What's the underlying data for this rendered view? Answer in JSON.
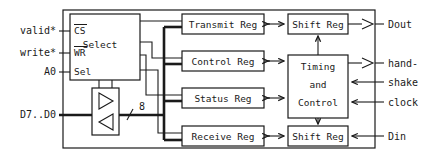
{
  "diagram": {
    "colors": {
      "line": "#1a1a1a",
      "background": "#ffffff",
      "box_fill": "#ffffff"
    }
  },
  "inputs_left": [
    {
      "label": "valid*",
      "name": "input-valid"
    },
    {
      "label": "write*",
      "name": "input-write"
    },
    {
      "label": "A0",
      "name": "input-a0"
    },
    {
      "label": "D7..D0",
      "name": "input-data-bus"
    }
  ],
  "select_block": {
    "label": "Select",
    "pins": [
      {
        "label": "CS",
        "overline": true
      },
      {
        "label": "WR",
        "overline": true
      },
      {
        "label": "Sel",
        "overline": false
      }
    ]
  },
  "bus": {
    "width_label": "8"
  },
  "registers": [
    {
      "label": "Transmit Reg",
      "name": "block-transmit-reg"
    },
    {
      "label": "Control Reg",
      "name": "block-control-reg"
    },
    {
      "label": "Status Reg",
      "name": "block-status-reg"
    },
    {
      "label": "Receive Reg",
      "name": "block-receive-reg"
    }
  ],
  "shift_regs": [
    {
      "label": "Shift Reg",
      "name": "block-shift-reg-tx"
    },
    {
      "label": "Shift Reg",
      "name": "block-shift-reg-rx"
    }
  ],
  "timing_block": {
    "line1": "Timing",
    "line2": "and",
    "line3": "Control"
  },
  "outputs_right": [
    {
      "label": "Dout",
      "name": "output-dout",
      "direction": "out"
    },
    {
      "label": "hand-",
      "label2": "shake",
      "name": "io-handshake",
      "direction": "bidirectional"
    },
    {
      "label": "clock",
      "name": "input-clock",
      "direction": "in"
    },
    {
      "label": "Din",
      "name": "input-din",
      "direction": "in"
    }
  ]
}
